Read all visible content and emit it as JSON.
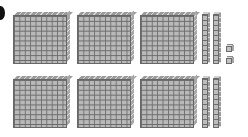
{
  "diagram": {
    "type": "base-ten-blocks",
    "represented_value": 642,
    "colors": {
      "block_fill": "#b9b9b9",
      "grid_line": "#6d6d6d",
      "background": "#ffffff"
    },
    "hundreds": {
      "count": 6,
      "rows": [
        3,
        3
      ]
    },
    "tens": {
      "count": 4,
      "rows": [
        2,
        2
      ]
    },
    "ones": {
      "count": 2
    },
    "label_mark": ")"
  }
}
